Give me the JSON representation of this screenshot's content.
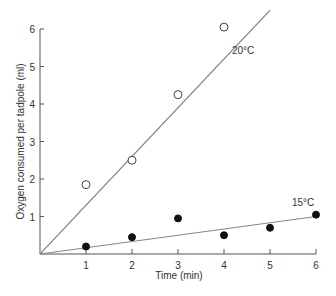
{
  "chart_data": {
    "type": "scatter",
    "title": "",
    "xlabel": "Time (min)",
    "ylabel": "Oxygen consumed per tadpole (ml)",
    "xlim": [
      0,
      6
    ],
    "ylim": [
      0,
      6
    ],
    "x_ticks": [
      "1",
      "2",
      "3",
      "4",
      "5",
      "6"
    ],
    "y_ticks": [
      "1",
      "2",
      "3",
      "4",
      "5",
      "6"
    ],
    "grid": false,
    "legend": "inline labels",
    "series": [
      {
        "name": "20°C",
        "marker": "open-circle",
        "x": [
          1,
          2,
          3,
          4
        ],
        "y": [
          1.85,
          2.5,
          4.25,
          6.05
        ],
        "fit_line": {
          "x": [
            0,
            5.0
          ],
          "y": [
            0,
            6.5
          ]
        }
      },
      {
        "name": "15°C",
        "marker": "filled-circle",
        "x": [
          1,
          2,
          3,
          4,
          5,
          6
        ],
        "y": [
          0.2,
          0.45,
          0.95,
          0.5,
          0.7,
          1.05
        ],
        "fit_line": {
          "x": [
            0,
            6
          ],
          "y": [
            0,
            1.0
          ]
        }
      }
    ]
  }
}
